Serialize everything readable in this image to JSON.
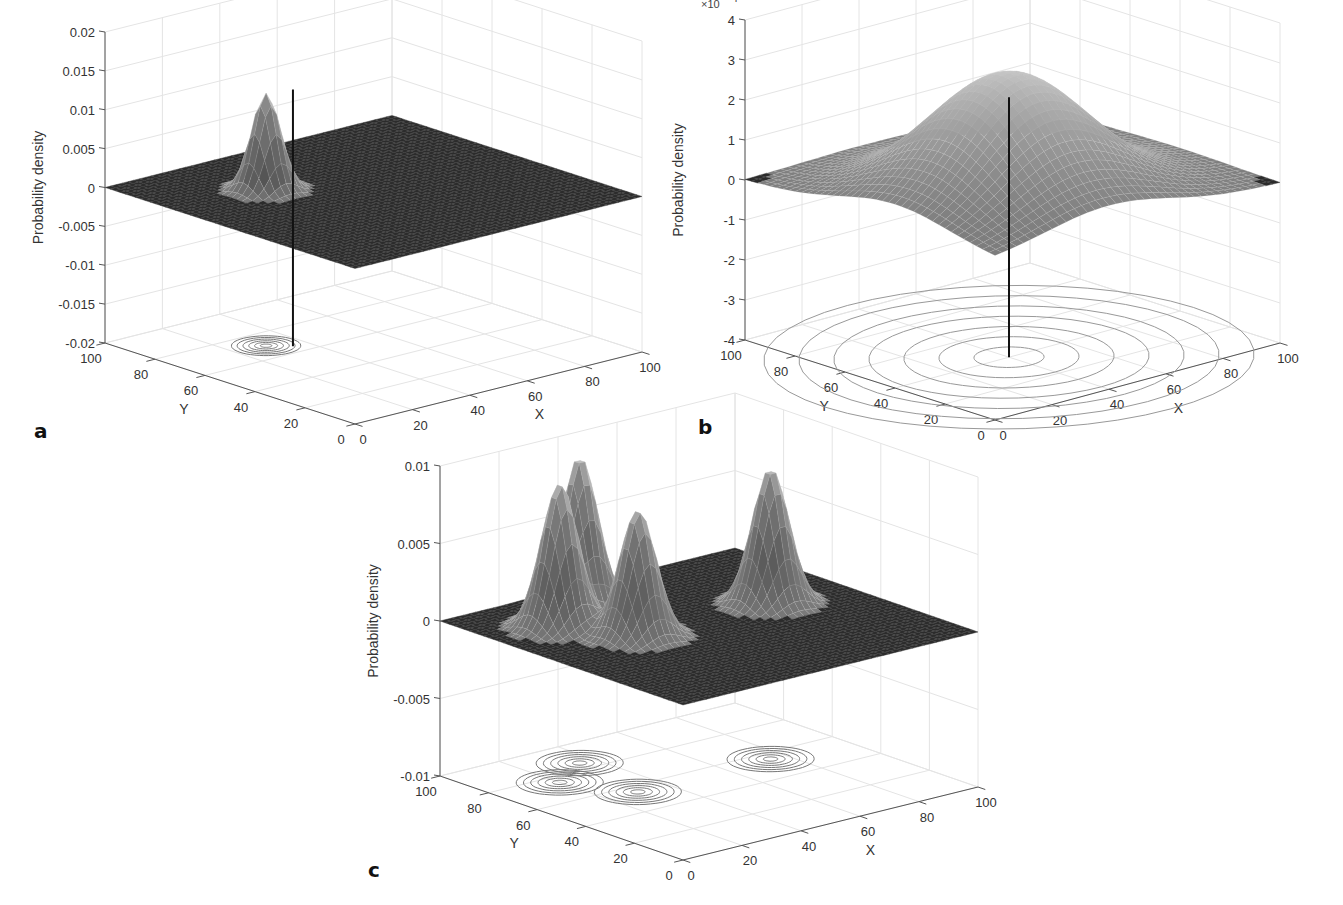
{
  "figure": {
    "panels": [
      {
        "letter": "a"
      },
      {
        "letter": "b"
      },
      {
        "letter": "c"
      }
    ]
  },
  "chart_data": [
    {
      "type": "surface3d",
      "panel": "a",
      "title": "",
      "xlabel": "X",
      "ylabel": "Y",
      "zlabel": "Probability density",
      "xlim": [
        0,
        100
      ],
      "ylim": [
        0,
        100
      ],
      "zlim": [
        -0.02,
        0.02
      ],
      "xticks": [
        "0",
        "20",
        "40",
        "60",
        "80",
        "100"
      ],
      "yticks": [
        "0",
        "20",
        "40",
        "60",
        "80",
        "100"
      ],
      "zticks": [
        "-0.02",
        "-0.015",
        "-0.01",
        "-0.005",
        "0",
        "0.005",
        "0.01",
        "0.015",
        "0.02"
      ],
      "grid": true,
      "surface": {
        "description": "single narrow Gaussian peak on a flat zero plane",
        "peaks": [
          {
            "x": 30,
            "y": 70,
            "height": 0.0125,
            "sigma": 4
          }
        ]
      },
      "vertical_marker": {
        "x": 35,
        "y": 65,
        "z_range": [
          -0.02,
          0.013
        ]
      },
      "contour_projection": {
        "z": -0.02,
        "centers": [
          {
            "x": 30,
            "y": 70
          }
        ]
      },
      "exponent_label": ""
    },
    {
      "type": "surface3d",
      "panel": "b",
      "title": "",
      "xlabel": "X",
      "ylabel": "Y",
      "zlabel": "Probability density",
      "xlim": [
        0,
        100
      ],
      "ylim": [
        0,
        100
      ],
      "zlim": [
        -4,
        4
      ],
      "zscale_exponent": "×10^-4",
      "xticks": [
        "0",
        "20",
        "40",
        "60",
        "80",
        "100"
      ],
      "yticks": [
        "0",
        "20",
        "40",
        "60",
        "80",
        "100"
      ],
      "zticks": [
        "-4",
        "-3",
        "-2",
        "-1",
        "0",
        "1",
        "2",
        "3",
        "4"
      ],
      "grid": true,
      "surface": {
        "description": "single broad Gaussian peak on a flat zero plane",
        "peaks": [
          {
            "x": 40,
            "y": 40,
            "height": 3.1,
            "sigma": 22
          }
        ]
      },
      "vertical_marker": {
        "x": 40,
        "y": 40,
        "z_range": [
          -4,
          2.5
        ]
      },
      "contour_projection": {
        "z": -4,
        "centers": [
          {
            "x": 40,
            "y": 40
          }
        ],
        "rings": 7
      },
      "exponent_label": "×10"
    },
    {
      "type": "surface3d",
      "panel": "c",
      "title": "",
      "xlabel": "X",
      "ylabel": "Y",
      "zlabel": "Probability density",
      "xlim": [
        0,
        100
      ],
      "ylim": [
        0,
        100
      ],
      "zlim": [
        -0.01,
        0.01
      ],
      "xticks": [
        "0",
        "20",
        "40",
        "60",
        "80",
        "100"
      ],
      "yticks": [
        "0",
        "20",
        "40",
        "60",
        "80",
        "100"
      ],
      "zticks": [
        "-0.01",
        "-0.005",
        "0",
        "0.005",
        "0.01"
      ],
      "grid": true,
      "surface": {
        "description": "four Gaussian peaks on a flat zero plane",
        "peaks": [
          {
            "x": 20,
            "y": 75,
            "height": 0.0093,
            "sigma": 5
          },
          {
            "x": 35,
            "y": 85,
            "height": 0.0098,
            "sigma": 5
          },
          {
            "x": 30,
            "y": 55,
            "height": 0.0082,
            "sigma": 5
          },
          {
            "x": 75,
            "y": 55,
            "height": 0.0088,
            "sigma": 5
          }
        ]
      },
      "contour_projection": {
        "z": -0.01,
        "centers": [
          {
            "x": 20,
            "y": 75
          },
          {
            "x": 35,
            "y": 85
          },
          {
            "x": 30,
            "y": 55
          },
          {
            "x": 75,
            "y": 55
          }
        ]
      },
      "exponent_label": ""
    }
  ]
}
